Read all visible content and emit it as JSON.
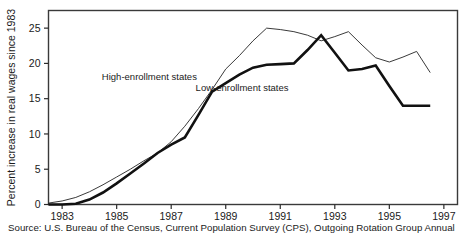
{
  "figure": {
    "source_note": "Source: U.S. Bureau of the Census, Current Population Survey (CPS), Outgoing Rotation Group Annual",
    "frame_color": "#3a3a3a",
    "background": "#ffffff"
  },
  "chart_data": {
    "type": "line",
    "title": "",
    "xlabel": "",
    "ylabel": "Percent increase in real wages since 1983",
    "xlim": [
      1982.5,
      1997.5
    ],
    "ylim": [
      0,
      27.5
    ],
    "xticks": [
      1983,
      1985,
      1987,
      1989,
      1991,
      1993,
      1995,
      1997
    ],
    "xtick_labels": [
      "1983",
      "1985",
      "1987",
      "1989",
      "1991",
      "1993",
      "1995",
      "1997"
    ],
    "yticks": [
      0,
      5,
      10,
      15,
      20,
      25
    ],
    "ytick_labels": [
      "0",
      "5",
      "10",
      "15",
      "20",
      "25"
    ],
    "grid": false,
    "legend": "inline-annotations",
    "series": [
      {
        "name": "High-enrollment states",
        "color": "#3a3a3a",
        "line_width": 1,
        "label_x": 1986.2,
        "label_y": 17.6,
        "x": [
          1982.5,
          1983.0,
          1983.5,
          1984.0,
          1984.5,
          1985.0,
          1985.5,
          1986.0,
          1986.5,
          1987.0,
          1987.5,
          1988.0,
          1988.5,
          1989.0,
          1989.5,
          1990.0,
          1990.5,
          1991.0,
          1991.5,
          1992.0,
          1992.5,
          1993.0,
          1993.5,
          1994.0,
          1994.5,
          1995.0,
          1995.5,
          1996.0,
          1996.5
        ],
        "y": [
          0.2,
          0.5,
          1.0,
          1.8,
          2.8,
          3.9,
          5.0,
          6.2,
          7.3,
          8.9,
          11.1,
          13.6,
          16.3,
          19.2,
          21.1,
          23.2,
          25.0,
          24.8,
          24.5,
          24.0,
          23.2,
          23.8,
          24.5,
          22.6,
          20.8,
          20.2,
          20.9,
          21.7,
          18.7
        ]
      },
      {
        "name": "Low-enrollment states",
        "color": "#111111",
        "line_width": 2.6,
        "label_x": 1989.6,
        "label_y": 16.1,
        "x": [
          1982.5,
          1983.0,
          1983.5,
          1984.0,
          1984.5,
          1985.0,
          1985.5,
          1986.0,
          1986.5,
          1987.0,
          1987.5,
          1988.0,
          1988.5,
          1989.0,
          1989.5,
          1990.0,
          1990.5,
          1991.0,
          1991.5,
          1992.0,
          1992.5,
          1993.0,
          1993.5,
          1994.0,
          1994.5,
          1995.0,
          1995.5,
          1996.0,
          1996.5
        ],
        "y": [
          0.0,
          0.0,
          0.1,
          0.7,
          1.7,
          3.0,
          4.4,
          5.8,
          7.3,
          8.5,
          9.5,
          12.7,
          16.0,
          17.2,
          18.4,
          19.4,
          19.8,
          19.9,
          20.0,
          21.9,
          24.0,
          21.5,
          19.0,
          19.2,
          19.7,
          16.8,
          14.0,
          14.0,
          14.0
        ]
      }
    ],
    "annotations": [
      {
        "text": "High-enrollment states",
        "x": 1986.2,
        "y": 17.6
      },
      {
        "text": "Low-enrollment states",
        "x": 1989.6,
        "y": 16.1
      }
    ]
  }
}
